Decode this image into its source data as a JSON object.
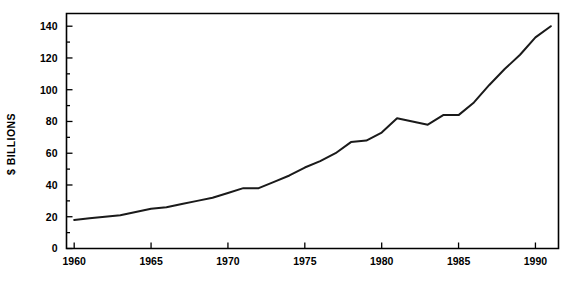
{
  "chart_data": {
    "type": "line",
    "title": "",
    "subtitle": "",
    "xlabel": "",
    "ylabel": "$ BILLIONS",
    "xlim": [
      1959.5,
      1991.5
    ],
    "ylim": [
      0,
      148
    ],
    "grid": false,
    "legend": null,
    "legend_position": "none",
    "annotations": [],
    "ytick_labels": [
      "0",
      "20",
      "40",
      "60",
      "80",
      "100",
      "120",
      "140"
    ],
    "ytick_values": [
      0,
      20,
      40,
      60,
      80,
      100,
      120,
      140
    ],
    "ytick_minor_values": [
      10,
      30,
      50,
      70,
      90,
      110,
      130
    ],
    "xtick_labels": [
      "1960",
      "1965",
      "1970",
      "1975",
      "1980",
      "1985",
      "1990"
    ],
    "xtick_values": [
      1960,
      1965,
      1970,
      1975,
      1980,
      1985,
      1990
    ],
    "line_color": "#1a1a1a",
    "x": [
      1960,
      1961,
      1962,
      1963,
      1964,
      1965,
      1966,
      1967,
      1968,
      1969,
      1970,
      1971,
      1972,
      1973,
      1974,
      1975,
      1976,
      1977,
      1978,
      1979,
      1980,
      1981,
      1982,
      1983,
      1984,
      1985,
      1986,
      1987,
      1988,
      1989,
      1990,
      1991
    ],
    "values": [
      18,
      19,
      20,
      21,
      23,
      25,
      26,
      28,
      30,
      32,
      35,
      38,
      38,
      42,
      46,
      51,
      55,
      60,
      67,
      68,
      73,
      82,
      80,
      78,
      84,
      84,
      92,
      103,
      113,
      122,
      133,
      140
    ],
    "series": [
      {
        "name": "$ Billions",
        "values": [
          18,
          19,
          20,
          21,
          23,
          25,
          26,
          28,
          30,
          32,
          35,
          38,
          38,
          42,
          46,
          51,
          55,
          60,
          67,
          68,
          73,
          82,
          80,
          78,
          84,
          84,
          92,
          103,
          113,
          122,
          133,
          140
        ]
      }
    ]
  },
  "figure": {
    "axis_label_y": "$ BILLIONS"
  }
}
